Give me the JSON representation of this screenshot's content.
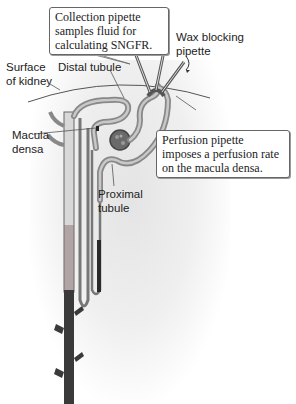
{
  "figure": {
    "callouts": {
      "collection": "Collection pipette samples fluid for calculating SNGFR.",
      "perfusion": "Perfusion pipette imposes a perfusion rate on the macula densa."
    },
    "labels": {
      "wax": "Wax blocking pipette",
      "surface": "Surface of kidney",
      "distal": "Distal tubule",
      "macula": "Macula densa",
      "proximal": "Proximal tubule"
    },
    "colors": {
      "tubule": "#8a8a8a",
      "collecting_duct": "#3a3a3a",
      "surface_line": "#555555"
    }
  }
}
